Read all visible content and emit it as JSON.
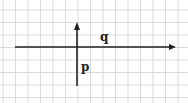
{
  "diagram": {
    "type": "coordinate-axes-on-grid",
    "background_color": "#ffffff",
    "grid_color": "#dcdcdc",
    "axis_color": "#222222",
    "grid": {
      "vertical_lines_x": [
        3,
        15.5,
        28,
        40.5,
        53,
        65.5,
        78,
        90.5,
        103,
        115.5,
        128,
        140.5,
        153,
        165.5,
        178
      ],
      "horizontal_lines_y": [
        10,
        22.5,
        35,
        47.5,
        60,
        72.5,
        85,
        97.5
      ]
    },
    "axes": {
      "horizontal": {
        "x1": 15,
        "y": 47,
        "x2": 176,
        "arrow": "right"
      },
      "vertical": {
        "x": 77,
        "y1": 86,
        "y2": 22,
        "arrow": "up"
      }
    },
    "labels": {
      "q": "q",
      "p": "p"
    }
  }
}
